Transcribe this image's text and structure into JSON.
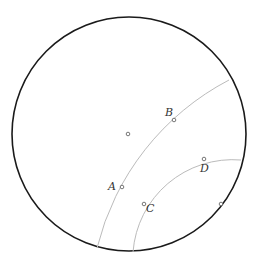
{
  "diagram": {
    "type": "poincare-disk",
    "colors": {
      "boundary": "#1a1a1a",
      "geodesic": "#bbbbbb",
      "point": "#555555",
      "label": "#333333"
    },
    "disk": {
      "cx": 129,
      "cy": 134,
      "r": 117
    },
    "center_point": {
      "x": 128,
      "y": 134
    },
    "points": [
      {
        "name": "A",
        "x": 122,
        "y": 187,
        "label": "A",
        "lx": 108,
        "ly": 190
      },
      {
        "name": "B",
        "x": 174,
        "y": 120,
        "label": "B",
        "lx": 165,
        "ly": 116
      },
      {
        "name": "C",
        "x": 144,
        "y": 204,
        "label": "C",
        "lx": 146,
        "ly": 212
      },
      {
        "name": "D",
        "x": 204,
        "y": 159,
        "label": "D",
        "lx": 200,
        "ly": 172
      }
    ],
    "boundary_point": {
      "x": 221,
      "y": 204
    },
    "geodesics": [
      {
        "name": "geodesic-AB",
        "x1": 97,
        "y1": 248,
        "x2": 229,
        "y2": 80,
        "r": 260
      },
      {
        "name": "geodesic-CD",
        "x1": 133,
        "y1": 252,
        "x2": 241,
        "y2": 160,
        "r": 100
      }
    ]
  }
}
